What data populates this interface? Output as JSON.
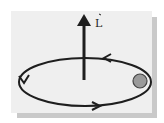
{
  "diagram": {
    "vector_label": "L",
    "background_color": "#efefef",
    "line_color": "#1e1e1e",
    "ball_color": "#9a9a9a",
    "orbit_direction": "counterclockwise (viewed from above)",
    "elements": [
      "angular-momentum-arrow",
      "orbit-ellipse",
      "orbiting-ball",
      "direction-arrows"
    ]
  }
}
